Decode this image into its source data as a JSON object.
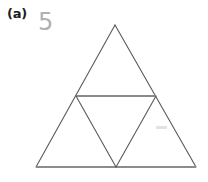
{
  "figure": {
    "panel_label": "(a)",
    "annotation_digit": "5",
    "background_color": "#ffffff"
  },
  "colors": {
    "label_text": "#1c1c1c",
    "digit_text": "#b0b0b0",
    "outer_edge": "#5a5a5a",
    "base_line": "#8c8c8c",
    "midline": "#8a8a8a",
    "inner_edge": "#5a5a5a",
    "smudge": "#e2e2e2"
  },
  "diagram": {
    "type": "subdivided-triangle",
    "name": "equilateral triangle divided into four sub-triangles",
    "sub_triangle_count": "4",
    "vertices": {
      "apex": {
        "x": 115,
        "y": 25
      },
      "bottom_left": {
        "x": 36,
        "y": 167
      },
      "bottom_right": {
        "x": 196,
        "y": 167
      },
      "mid_left": {
        "x": 76,
        "y": 96
      },
      "mid_right": {
        "x": 156,
        "y": 96
      },
      "mid_bottom": {
        "x": 116,
        "y": 167
      }
    },
    "edges": [
      {
        "name": "outer-left-edge",
        "from": "apex",
        "to": "bottom_left",
        "color": "#5a5a5a",
        "width": 1.1
      },
      {
        "name": "outer-right-edge",
        "from": "apex",
        "to": "bottom_right",
        "color": "#5a5a5a",
        "width": 1.1
      },
      {
        "name": "base-edge",
        "from": "bottom_left",
        "to": "bottom_right",
        "color": "#8c8c8c",
        "width": 2.2
      },
      {
        "name": "midline-edge",
        "from": "mid_left",
        "to": "mid_right",
        "color": "#8a8a8a",
        "width": 2.2
      },
      {
        "name": "inner-left-edge",
        "from": "mid_left",
        "to": "mid_bottom",
        "color": "#5a5a5a",
        "width": 1.1
      },
      {
        "name": "inner-right-edge",
        "from": "mid_right",
        "to": "mid_bottom",
        "color": "#5a5a5a",
        "width": 1.1
      }
    ],
    "regions": [
      {
        "name": "top-sub-triangle",
        "orientation": "upright"
      },
      {
        "name": "left-sub-triangle",
        "orientation": "upright"
      },
      {
        "name": "right-sub-triangle",
        "orientation": "upright"
      },
      {
        "name": "center-sub-triangle",
        "orientation": "inverted"
      }
    ],
    "marks": [
      {
        "name": "faint-pencil-dash",
        "x": 156,
        "y": 126,
        "width": 11,
        "height": 3
      }
    ]
  }
}
